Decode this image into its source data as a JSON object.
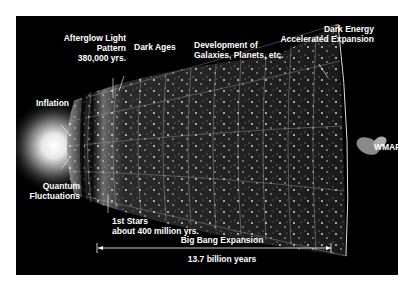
{
  "figure": {
    "title_fragment": "",
    "labels": {
      "afterglow": [
        "Afterglow Light",
        "Pattern",
        "380,000 yrs."
      ],
      "dark_ages": "Dark Ages",
      "development": [
        "Development of",
        "Galaxies, Planets, etc."
      ],
      "dark_energy": [
        "Dark Energy",
        "Accelerated Expansion"
      ],
      "inflation": "Inflation",
      "quantum": [
        "Quantum",
        "Fluctuations"
      ],
      "wmap": "WMAP",
      "first_stars": [
        "1st Stars",
        "about 400 million yrs."
      ],
      "expansion": "Big Bang Expansion",
      "duration": "13.7 billion years"
    },
    "colors": {
      "background": "#000000",
      "text": "#ffffff",
      "page": "#ffffff"
    }
  }
}
